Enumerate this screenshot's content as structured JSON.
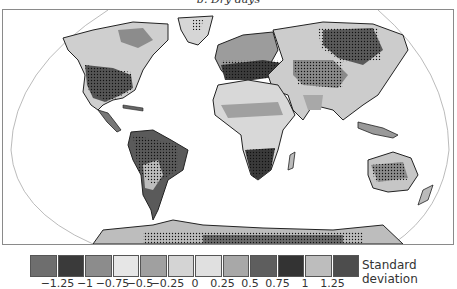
{
  "title": "b. Dry days",
  "map": {
    "projection": "Robinson",
    "description": "Global map of dry days anomaly in standard deviations; stippling marks significant regions",
    "regions": [
      {
        "name": "north-america",
        "shade": "light"
      },
      {
        "name": "us-southwest",
        "shade": "dark",
        "stippled": true
      },
      {
        "name": "greenland",
        "shade": "light"
      },
      {
        "name": "south-america",
        "shade": "dark",
        "stippled": true
      },
      {
        "name": "europe-mediterranean",
        "shade": "dark",
        "stippled": true
      },
      {
        "name": "eurasia",
        "shade": "light"
      },
      {
        "name": "siberia",
        "shade": "dark",
        "stippled": true
      },
      {
        "name": "central-asia",
        "shade": "medium",
        "stippled": true
      },
      {
        "name": "africa",
        "shade": "light"
      },
      {
        "name": "southern-africa",
        "shade": "dark",
        "stippled": true
      },
      {
        "name": "australia",
        "shade": "medium",
        "stippled": true
      },
      {
        "name": "antarctica",
        "shade": "medium",
        "stippled": true
      }
    ]
  },
  "legend": {
    "label": "Standard deviation",
    "colors": [
      "#6e6e6e",
      "#3a3a3a",
      "#8c8c8c",
      "#e6e6e6",
      "#a0a0a0",
      "#d4d4d4",
      "#e0e0e0",
      "#a8a8a8",
      "#5e5e5e",
      "#333333",
      "#bdbdbd",
      "#4d4d4d"
    ],
    "ticks": [
      "−1.25",
      "−1",
      "−0.75",
      "−0.5",
      "−0.25",
      "0",
      "0.25",
      "0.5",
      "0.75",
      "1",
      "1.25"
    ]
  }
}
